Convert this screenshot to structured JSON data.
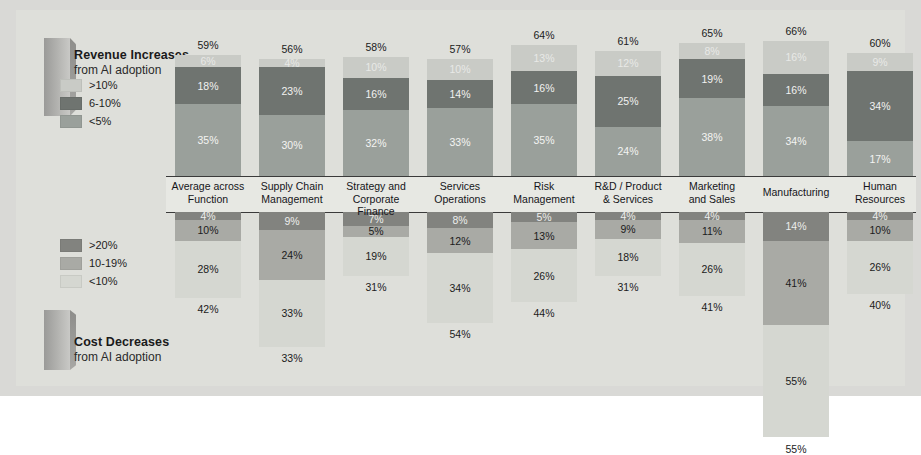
{
  "panels": {
    "revenue": {
      "title": "Revenue Increases",
      "subtitle": "from AI adoption"
    },
    "cost": {
      "title": "Cost Decreases",
      "subtitle": "from AI adoption"
    }
  },
  "legends": {
    "revenue": [
      {
        "label": ">10%",
        "color": "#c9cbc6"
      },
      {
        "label": "6-10%",
        "color": "#6f7470"
      },
      {
        "label": "<5%",
        "color": "#9aa09b"
      }
    ],
    "cost": [
      {
        "label": ">20%",
        "color": "#82837f"
      },
      {
        "label": "10-19%",
        "color": "#a9aaa5"
      },
      {
        "label": "<10%",
        "color": "#d5d7d1"
      }
    ]
  },
  "chart_data": {
    "type": "bar",
    "xlabel": "",
    "ylabel": "",
    "grid": false,
    "legend_position": "left",
    "stacked": true,
    "categories": [
      "Average across Function",
      "Supply Chain Management",
      "Strategy and Corporate Finance",
      "Services Operations",
      "Risk Management",
      "R&D / Product & Services",
      "Marketing and Sales",
      "Manufacturing",
      "Human Resources"
    ],
    "category_lines": [
      [
        "Average across",
        "Function"
      ],
      [
        "Supply Chain",
        "Management"
      ],
      [
        "Strategy and",
        "Corporate Finance"
      ],
      [
        "Services",
        "Operations"
      ],
      [
        "Risk",
        "Management"
      ],
      [
        "R&D / Product",
        "& Services"
      ],
      [
        "Marketing",
        "and Sales"
      ],
      [
        "Manufacturing",
        ""
      ],
      [
        "Human",
        "Resources"
      ]
    ],
    "panels": [
      {
        "name": "Revenue Increases",
        "direction": "up",
        "series": [
          {
            "name": "<5%",
            "color": "#9aa09b",
            "values": [
              35,
              30,
              32,
              33,
              35,
              24,
              38,
              34,
              17
            ]
          },
          {
            "name": "6-10%",
            "color": "#6f7470",
            "values": [
              18,
              23,
              16,
              14,
              16,
              25,
              19,
              16,
              34
            ]
          },
          {
            "name": ">10%",
            "color": "#c9cbc6",
            "values": [
              6,
              4,
              10,
              10,
              13,
              12,
              8,
              16,
              9
            ]
          }
        ],
        "totals": [
          59,
          56,
          58,
          57,
          64,
          61,
          65,
          66,
          60
        ]
      },
      {
        "name": "Cost Decreases",
        "direction": "down",
        "series": [
          {
            "name": ">20%",
            "color": "#82837f",
            "values": [
              4,
              9,
              7,
              8,
              5,
              4,
              4,
              14,
              4
            ]
          },
          {
            "name": "10-19%",
            "color": "#a9aaa5",
            "values": [
              10,
              24,
              5,
              12,
              13,
              9,
              11,
              41,
              10
            ]
          },
          {
            "name": "<10%",
            "color": "#d5d7d1",
            "values": [
              28,
              33,
              19,
              34,
              26,
              18,
              26,
              55,
              26
            ]
          }
        ],
        "totals": [
          42,
          33,
          31,
          54,
          44,
          31,
          41,
          55,
          40
        ]
      }
    ]
  }
}
